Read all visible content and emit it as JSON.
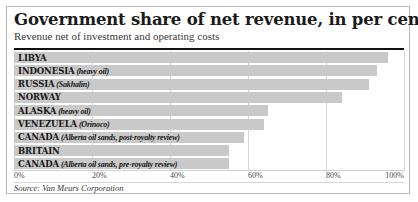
{
  "header": {
    "title": "Government share of net revenue, in per cent",
    "subtitle": "Revenue net of investment and operating costs"
  },
  "source": "Source: Van Meurs Corporation",
  "colors": {
    "bar": "#c9c9c9",
    "gridline": "#d8d8d8",
    "rule": "#111111",
    "text": "#151515"
  },
  "chart_data": {
    "type": "bar",
    "orientation": "horizontal",
    "title": "Government share of net revenue, in per cent",
    "subtitle": "Revenue net of investment and operating costs",
    "xlabel": "",
    "ylabel": "",
    "xlim": [
      0,
      100
    ],
    "grid": true,
    "legend": "none",
    "tick_labels": [
      "0%",
      "20%",
      "40%",
      "60%",
      "80%",
      "100%"
    ],
    "ticks": [
      0,
      20,
      40,
      60,
      80,
      100
    ],
    "categories": [
      "LIBYA",
      "INDONESIA (heavy oil)",
      "RUSSIA (Sakhalin)",
      "NORWAY",
      "ALASKA (heavy oil)",
      "VENEZUELA (Orinoco)",
      "CANADA (Alberta oil sands, post-royalty review)",
      "BRITAIN",
      "CANADA (Alberta oil sands, pre-royalty review)"
    ],
    "values": [
      96,
      93,
      91,
      84,
      65,
      64,
      59,
      55,
      55
    ],
    "rows": [
      {
        "name": "LIBYA",
        "qualifier": "",
        "value": 96
      },
      {
        "name": "INDONESIA",
        "qualifier": "(heavy oil)",
        "value": 93
      },
      {
        "name": "RUSSIA",
        "qualifier": "(Sakhalin)",
        "value": 91
      },
      {
        "name": "NORWAY",
        "qualifier": "",
        "value": 84
      },
      {
        "name": "ALASKA",
        "qualifier": "(heavy oil)",
        "value": 65
      },
      {
        "name": "VENEZUELA",
        "qualifier": "(Orinoco)",
        "value": 64
      },
      {
        "name": "CANADA",
        "qualifier": "(Alberta oil sands, post-royalty review)",
        "value": 59
      },
      {
        "name": "BRITAIN",
        "qualifier": "",
        "value": 55
      },
      {
        "name": "CANADA",
        "qualifier": "(Alberta oil sands, pre-royalty review)",
        "value": 55
      }
    ]
  }
}
